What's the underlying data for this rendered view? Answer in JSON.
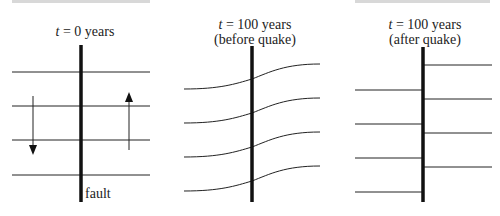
{
  "panels": [
    {
      "title_var": "t",
      "title_rest": " = 0 years",
      "subtitle": ""
    },
    {
      "title_var": "t",
      "title_rest": " = 100 years",
      "subtitle": "(before quake)"
    },
    {
      "title_var": "t",
      "title_rest": " = 100 years",
      "subtitle": "(after quake)"
    }
  ],
  "fault_label": "fault",
  "colors": {
    "line": "#222222",
    "fault": "#111111",
    "topbar": "#d8d8d8"
  }
}
